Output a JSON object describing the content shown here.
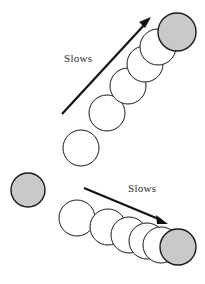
{
  "figure": {
    "title": "Slows",
    "background_color": "#ffffff",
    "stroke_color": "#1a1a1a",
    "ball_open_color": "#ffffff",
    "ball_filled_color": "#c9c9c9",
    "arrow_color": "#111111",
    "width": 205,
    "height": 284
  },
  "panels": [
    {
      "id": "upper",
      "label": "Slows",
      "label_x": 64,
      "label_y": 62,
      "direction": "up-right",
      "arrow": {
        "x1": 62,
        "y1": 114,
        "x2": 150,
        "y2": 19,
        "head_angle_deg": -47
      },
      "balls": [
        {
          "cx": 81,
          "cy": 148,
          "r": 18,
          "fill": "open"
        },
        {
          "cx": 107,
          "cy": 113,
          "r": 18,
          "fill": "open"
        },
        {
          "cx": 128,
          "cy": 86,
          "r": 18,
          "fill": "open"
        },
        {
          "cx": 145,
          "cy": 64,
          "r": 18,
          "fill": "open"
        },
        {
          "cx": 158,
          "cy": 47,
          "r": 18,
          "fill": "open"
        },
        {
          "cx": 177,
          "cy": 32,
          "r": 19,
          "fill": "filled"
        }
      ]
    },
    {
      "id": "lower",
      "label": "Slows",
      "label_x": 128,
      "label_y": 192,
      "direction": "right-down",
      "arrow": {
        "x1": 84,
        "y1": 188,
        "x2": 167,
        "y2": 223,
        "head_angle_deg": 23
      },
      "balls": [
        {
          "cx": 28,
          "cy": 190,
          "r": 17,
          "fill": "filled"
        },
        {
          "cx": 77,
          "cy": 218,
          "r": 18,
          "fill": "open"
        },
        {
          "cx": 108,
          "cy": 227,
          "r": 18,
          "fill": "open"
        },
        {
          "cx": 129,
          "cy": 235,
          "r": 18,
          "fill": "open"
        },
        {
          "cx": 147,
          "cy": 241,
          "r": 18,
          "fill": "open"
        },
        {
          "cx": 161,
          "cy": 245,
          "r": 18,
          "fill": "open"
        },
        {
          "cx": 178,
          "cy": 247,
          "r": 18,
          "fill": "filled"
        }
      ]
    }
  ],
  "chart_data": {
    "type": "scatter",
    "title": "Slows",
    "xlabel": "",
    "ylabel": "",
    "series": [
      {
        "name": "upper-path",
        "annotation": "Slows",
        "x": [
          81,
          107,
          128,
          145,
          158,
          177
        ],
        "y": [
          148,
          113,
          86,
          64,
          47,
          32
        ],
        "marker_fill": [
          "open",
          "open",
          "open",
          "open",
          "open",
          "filled"
        ]
      },
      {
        "name": "lower-path",
        "annotation": "Slows",
        "x": [
          28,
          77,
          108,
          129,
          147,
          161,
          178
        ],
        "y": [
          190,
          218,
          227,
          235,
          241,
          245,
          247
        ],
        "marker_fill": [
          "filled",
          "open",
          "open",
          "open",
          "open",
          "open",
          "filled"
        ]
      }
    ],
    "legend": [],
    "grid": false
  }
}
